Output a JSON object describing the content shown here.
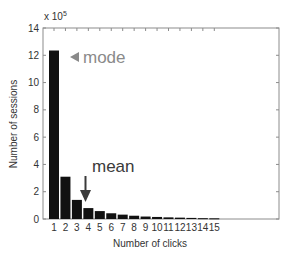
{
  "chart_data": {
    "type": "bar",
    "title": "",
    "xlabel": "Number of clicks",
    "ylabel": "Number of sessions",
    "y_multiplier_label": "x 10",
    "y_multiplier_exponent": "5",
    "categories": [
      "1",
      "2",
      "3",
      "4",
      "5",
      "6",
      "7",
      "8",
      "9",
      "10",
      "11",
      "12",
      "13",
      "14",
      "15"
    ],
    "values": [
      12.35,
      3.1,
      1.4,
      0.8,
      0.58,
      0.42,
      0.32,
      0.24,
      0.18,
      0.15,
      0.12,
      0.1,
      0.08,
      0.06,
      0.05
    ],
    "value_scale": 100000,
    "ylim": [
      0,
      14
    ],
    "yticks": [
      "0",
      "2",
      "4",
      "6",
      "8",
      "10",
      "12",
      "14"
    ],
    "grid": false,
    "legend": null,
    "bar_color": "#111111",
    "annotations": [
      {
        "text": "mode",
        "marker": "◀",
        "target_category": "1",
        "color": "#8a8a8a"
      },
      {
        "text": "mean",
        "marker": "arrow-down",
        "target_x": 3.45,
        "color": "#3a3a3a"
      }
    ]
  }
}
